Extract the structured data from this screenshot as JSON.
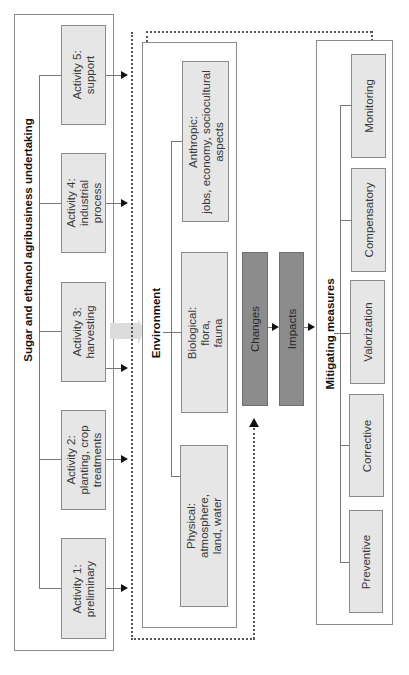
{
  "undertaking": {
    "title": "Sugar and ethanol agribusiness undertaking",
    "activities": [
      {
        "label": "Activity 5:\nsupport"
      },
      {
        "label": "Activity 4:\nindustrial\nprocess"
      },
      {
        "label": "Activity 3:\nharvesting"
      },
      {
        "label": "Activity 2:\nplanting, crop\ntreatments"
      },
      {
        "label": "Activity 1:\npreliminary"
      }
    ]
  },
  "environment": {
    "title": "Environment",
    "components": [
      {
        "label": "Anthropic:\njobs, economy, sociocultural\naspects"
      },
      {
        "label": "Biological:\nflora,\nfauna"
      },
      {
        "label": "Physical:\natmosphere,\nland, water"
      }
    ]
  },
  "flow": {
    "changes": "Changes",
    "impacts": "Impacts"
  },
  "mitigating": {
    "title": "Mitigating measures",
    "measures": [
      {
        "label": "Monitoring"
      },
      {
        "label": "Compensatory"
      },
      {
        "label": "Valorization"
      },
      {
        "label": "Corrective"
      },
      {
        "label": "Preventive"
      }
    ]
  },
  "colors": {
    "node_fill": "#e6e6e6",
    "dark_fill": "#8c8c8c",
    "border": "#8a8a8a"
  }
}
